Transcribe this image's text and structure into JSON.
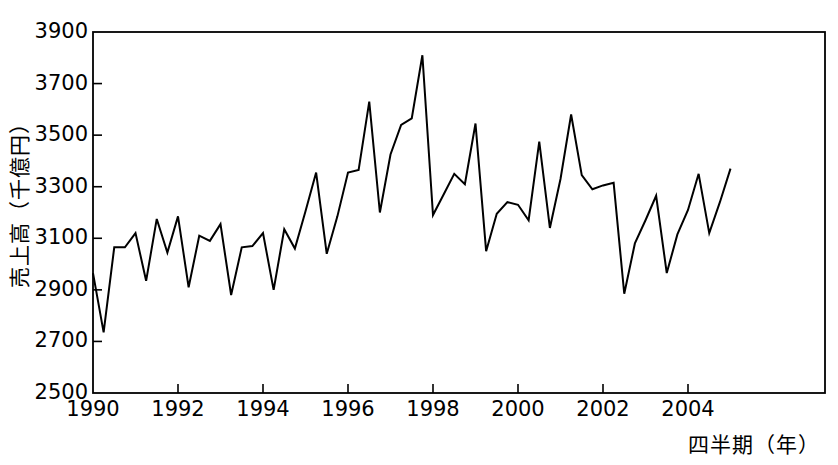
{
  "chart_data": {
    "type": "line",
    "title": "",
    "xlabel": "四半期（年）",
    "ylabel": "売上高（千億円）",
    "ylim": [
      2500,
      3900
    ],
    "yticks": [
      2500,
      2700,
      2900,
      3100,
      3300,
      3500,
      3700,
      3900
    ],
    "xlim": [
      1990.0,
      1995.25
    ],
    "xticks": [
      1990,
      1992,
      1994,
      1996,
      1998,
      2000,
      2002,
      2004
    ],
    "xticklabels": [
      "1990",
      "1992",
      "1994",
      "1996",
      "1998",
      "2000",
      "2002",
      "2004"
    ],
    "grid": false,
    "legend": null,
    "series_name": "売上高",
    "line_color": "#000000",
    "line_width": 2,
    "x": [
      1990.0,
      1990.25,
      1990.5,
      1990.75,
      1991.0,
      1991.25,
      1991.5,
      1991.75,
      1992.0,
      1992.25,
      1992.5,
      1992.75,
      1993.0,
      1993.25,
      1993.5,
      1993.75,
      1994.0,
      1994.25,
      1994.5,
      1994.75,
      1995.0,
      1995.25,
      1995.5,
      1995.75,
      1996.0,
      1996.25,
      1996.5,
      1996.75,
      1997.0,
      1997.25,
      1997.5,
      1997.75,
      1998.0,
      1998.25,
      1998.5,
      1998.75,
      1999.0,
      1999.25,
      1999.5,
      1999.75,
      2000.0,
      2000.25,
      2000.5,
      2000.75,
      2001.0,
      2001.25,
      2001.5,
      2001.75,
      2002.0,
      2002.25,
      2002.5,
      2002.75,
      2003.0,
      2003.25,
      2003.5,
      2003.75,
      2004.0,
      2004.25,
      2004.5,
      2004.75,
      2005.0
    ],
    "values": [
      2965,
      2735,
      3065,
      3065,
      3120,
      2935,
      3175,
      3045,
      3185,
      2910,
      3110,
      3090,
      3155,
      2880,
      3065,
      3070,
      3120,
      2900,
      3135,
      3060,
      3205,
      3355,
      3040,
      3185,
      3355,
      3365,
      3630,
      3200,
      3425,
      3540,
      3565,
      3810,
      3190,
      3270,
      3350,
      3310,
      3545,
      3050,
      3195,
      3240,
      3230,
      3170,
      3475,
      3140,
      3330,
      3580,
      3345,
      3290,
      3305,
      3315,
      2885,
      3080,
      3170,
      3265,
      2965,
      3115,
      3210,
      3350,
      3120,
      3240,
      3370
    ],
    "value_unit": "千億円",
    "n_points": 61
  },
  "axes": {
    "y_axis_name": "sales-axis",
    "x_axis_name": "quarter-axis"
  }
}
